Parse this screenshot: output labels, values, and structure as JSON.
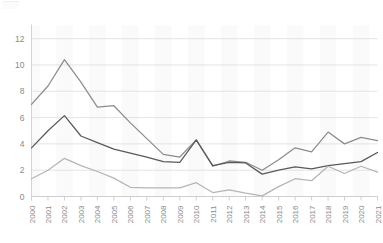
{
  "chart_data": {
    "type": "line",
    "title": "",
    "subtitle": "",
    "xlabel": "",
    "ylabel": "",
    "x": [
      2000,
      2001,
      2002,
      2003,
      2004,
      2005,
      2006,
      2007,
      2008,
      2009,
      2010,
      2011,
      2012,
      2013,
      2014,
      2015,
      2016,
      2017,
      2018,
      2019,
      2020,
      2021
    ],
    "categories": [
      "2000",
      "2001",
      "2002",
      "2003",
      "2004",
      "2005",
      "2006",
      "2007",
      "2008",
      "2009",
      "2010",
      "2011",
      "2012",
      "2013",
      "2014",
      "2015",
      "2016",
      "2017",
      "2018",
      "2019",
      "2020",
      "2021"
    ],
    "series": [
      {
        "name": "series-1",
        "color": "#8c8c8c",
        "values": [
          7.0,
          8.4,
          10.4,
          8.7,
          6.8,
          6.9,
          5.6,
          4.4,
          3.2,
          3.0,
          4.3,
          2.3,
          2.7,
          2.6,
          2.0,
          2.8,
          3.7,
          3.4,
          4.9,
          4.0,
          4.5,
          4.25
        ]
      },
      {
        "name": "series-2",
        "color": "#595959",
        "values": [
          3.7,
          5.0,
          6.15,
          4.6,
          4.1,
          3.6,
          3.3,
          3.0,
          2.65,
          2.6,
          4.3,
          2.35,
          2.6,
          2.55,
          1.7,
          2.0,
          2.25,
          2.1,
          2.35,
          2.5,
          2.65,
          3.35
        ]
      },
      {
        "name": "series-3",
        "color": "#b5b5b5",
        "values": [
          1.35,
          2.0,
          2.9,
          2.35,
          1.9,
          1.4,
          0.7,
          0.65,
          0.65,
          0.65,
          1.05,
          0.3,
          0.5,
          0.25,
          0.05,
          0.75,
          1.35,
          1.2,
          2.3,
          1.75,
          2.3,
          1.85
        ]
      }
    ],
    "ylim": [
      0,
      13
    ],
    "yticks": [
      0,
      2,
      4,
      6,
      8,
      10,
      12
    ],
    "ytick_labels": [
      "0",
      "2",
      "4",
      "6",
      "8",
      "10",
      "12"
    ],
    "xlim": [
      2000,
      2021
    ],
    "grid": "horizontal",
    "legend": "none",
    "background_bands": true,
    "xtick_rotation": -90
  }
}
